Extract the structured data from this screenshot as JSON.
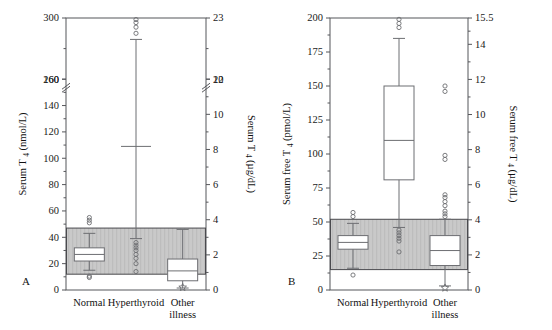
{
  "figure": {
    "width": 552,
    "height": 330,
    "background": "#ffffff",
    "band_color": "#c9c9c9",
    "line_color": "#6d6e72",
    "axis_color": "#55565a"
  },
  "panels": [
    {
      "id": "A",
      "label": "A",
      "left_axis": {
        "title_main": "Serum T",
        "title_sub": "4",
        "title_unit": "(nmol/L)",
        "unit_only": "nmol/L",
        "ticks": [
          0,
          20,
          40,
          60,
          80,
          100,
          120,
          140,
          160,
          260,
          300
        ],
        "minor_between": true,
        "axis_break": true,
        "break_between": [
          160,
          260
        ],
        "range_lower": [
          0,
          160
        ],
        "range_upper": [
          260,
          300
        ]
      },
      "right_axis": {
        "title_main": "Serum T",
        "title_sub": "4",
        "title_unit": "(µg/dL)",
        "unit_only": "µg/dL",
        "ticks": [
          0,
          2,
          4,
          6,
          8,
          10,
          12,
          20,
          23
        ],
        "axis_break": true
      },
      "reference_band": {
        "low": 12,
        "high": 47
      },
      "categories": [
        "Normal",
        "Hyperthyroid",
        "Other illness"
      ],
      "boxes": [
        {
          "category": "Normal",
          "whisker_low": 15,
          "q1": 22,
          "median": 27,
          "q3": 32,
          "whisker_high": 43,
          "outliers": [
            9.5,
            10.5,
            51,
            53,
            55
          ]
        },
        {
          "category": "Hyperthyroid",
          "whisker_low": 39,
          "q1": 69,
          "median": 109,
          "q3": 161,
          "whisker_high": 286,
          "outliers": [
            14,
            20,
            24,
            27,
            30,
            32,
            34,
            36,
            290,
            294,
            297,
            299
          ]
        },
        {
          "category": "Other illness",
          "whisker_low": 1.5,
          "q1": 7,
          "median": 14.5,
          "q3": 23.5,
          "whisker_high": 46,
          "outliers": [],
          "far_outlier_star": 2
        }
      ]
    },
    {
      "id": "B",
      "label": "B",
      "left_axis": {
        "title_main": "Serum free T",
        "title_sub": "4",
        "title_unit": "(pmol/L)",
        "unit_only": "pmol/L",
        "ticks": [
          0,
          25,
          50,
          75,
          100,
          125,
          150,
          175,
          200
        ],
        "minor_between": true,
        "axis_break": false,
        "range_lower": [
          0,
          200
        ]
      },
      "right_axis": {
        "title_main": "Serum free T",
        "title_sub": "4",
        "title_unit": "(µg/dL)",
        "unit_only": "µg/dL",
        "ticks": [
          0,
          2,
          4,
          6,
          8,
          10,
          12,
          14,
          15.5
        ],
        "axis_break": false
      },
      "reference_band": {
        "low": 15,
        "high": 52
      },
      "categories": [
        "Normal",
        "Hyperthyroid",
        "Other illness"
      ],
      "boxes": [
        {
          "category": "Normal",
          "whisker_low": 16,
          "q1": 30,
          "median": 35,
          "q3": 40,
          "whisker_high": 49,
          "outliers": [
            11,
            54,
            57
          ]
        },
        {
          "category": "Hyperthyroid",
          "whisker_low": 46,
          "q1": 81,
          "median": 110,
          "q3": 150,
          "whisker_high": 185,
          "outliers": [
            28,
            36,
            38,
            40,
            42,
            44,
            193,
            196,
            199
          ]
        },
        {
          "category": "Other illness",
          "whisker_low": 3,
          "q1": 18,
          "median": 29,
          "q3": 40,
          "whisker_high": 52,
          "outliers": [
            54,
            56,
            58,
            62,
            65,
            68,
            70,
            96,
            99,
            146,
            150
          ],
          "far_outlier_star": 1.5
        }
      ]
    }
  ],
  "chart_data": {
    "type": "box",
    "panel_count": 2,
    "panels": [
      {
        "panel": "A",
        "ylabel": "Serum T4 (nmol/L)",
        "ylabel_right": "Serum T4 (µg/dL)",
        "ylim": [
          0,
          300
        ],
        "yticks": [
          0,
          20,
          40,
          60,
          80,
          100,
          120,
          140,
          160,
          260,
          300
        ],
        "yticks_right": [
          0,
          2,
          4,
          6,
          8,
          10,
          12,
          20,
          23
        ],
        "axis_break": "between 160 and 260",
        "reference_interval": [
          12,
          47
        ],
        "categories": [
          "Normal",
          "Hyperthyroid",
          "Other illness"
        ],
        "series": [
          {
            "name": "Normal",
            "whisker_low": 15,
            "q1": 22,
            "median": 27,
            "q3": 32,
            "whisker_high": 43,
            "outliers": [
              9.5,
              10.5,
              51,
              53,
              55
            ]
          },
          {
            "name": "Hyperthyroid",
            "whisker_low": 39,
            "q1": 69,
            "median": 109,
            "q3": 161,
            "whisker_high": 286,
            "outliers": [
              14,
              20,
              24,
              27,
              30,
              32,
              34,
              36,
              290,
              294,
              297,
              299
            ]
          },
          {
            "name": "Other illness",
            "whisker_low": 1.5,
            "q1": 7,
            "median": 14.5,
            "q3": 23.5,
            "whisker_high": 46,
            "outliers": [
              2
            ]
          }
        ]
      },
      {
        "panel": "B",
        "ylabel": "Serum free T4 (pmol/L)",
        "ylabel_right": "Serum free T4 (µg/dL)",
        "ylim": [
          0,
          200
        ],
        "yticks": [
          0,
          25,
          50,
          75,
          100,
          125,
          150,
          175,
          200
        ],
        "yticks_right": [
          0,
          2,
          4,
          6,
          8,
          10,
          12,
          14,
          15.5
        ],
        "axis_break": "none",
        "reference_interval": [
          15,
          52
        ],
        "categories": [
          "Normal",
          "Hyperthyroid",
          "Other illness"
        ],
        "series": [
          {
            "name": "Normal",
            "whisker_low": 16,
            "q1": 30,
            "median": 35,
            "q3": 40,
            "whisker_high": 49,
            "outliers": [
              11,
              54,
              57
            ]
          },
          {
            "name": "Hyperthyroid",
            "whisker_low": 46,
            "q1": 81,
            "median": 110,
            "q3": 150,
            "whisker_high": 185,
            "outliers": [
              28,
              36,
              38,
              40,
              42,
              44,
              193,
              196,
              199
            ]
          },
          {
            "name": "Other illness",
            "whisker_low": 3,
            "q1": 18,
            "median": 29,
            "q3": 40,
            "whisker_high": 52,
            "outliers": [
              1.5,
              54,
              56,
              58,
              62,
              65,
              68,
              70,
              96,
              99,
              146,
              150
            ]
          }
        ]
      }
    ],
    "grid": false,
    "legend": "none"
  }
}
